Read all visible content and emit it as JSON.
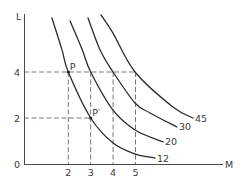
{
  "chart_data": {
    "type": "line",
    "title": "",
    "xlabel": "M",
    "ylabel": "L",
    "xlim": [
      0,
      8.9
    ],
    "ylim": [
      0,
      6.5
    ],
    "grid": false,
    "legend": "none (series labelled at curve ends)",
    "origin_label": "0",
    "x_ticks": [
      {
        "value": 2,
        "label": "2"
      },
      {
        "value": 3,
        "label": "3"
      },
      {
        "value": 4,
        "label": "4"
      },
      {
        "value": 5,
        "label": "5"
      }
    ],
    "y_ticks": [
      {
        "value": 2,
        "label": "2"
      },
      {
        "value": 4,
        "label": "4"
      }
    ],
    "series": [
      {
        "name": "12",
        "points": [
          [
            1.27,
            6.35
          ],
          [
            1.72,
            4.96
          ],
          [
            2,
            4
          ],
          [
            3,
            2
          ],
          [
            4,
            0.91
          ],
          [
            5,
            0.43
          ],
          [
            5.87,
            0.26
          ]
        ]
      },
      {
        "name": "20",
        "points": [
          [
            2.08,
            6.22
          ],
          [
            2.61,
            5.0
          ],
          [
            3,
            4
          ],
          [
            3.99,
            2.35
          ],
          [
            4.98,
            1.48
          ],
          [
            6.23,
            0.96
          ]
        ]
      },
      {
        "name": "30",
        "points": [
          [
            2.88,
            6.35
          ],
          [
            3.42,
            4.96
          ],
          [
            4,
            4
          ],
          [
            4.98,
            2.65
          ],
          [
            5.65,
            2.22
          ],
          [
            6.85,
            1.61
          ]
        ]
      },
      {
        "name": "45",
        "points": [
          [
            3.46,
            6.48
          ],
          [
            3.99,
            5.7
          ],
          [
            4.98,
            4
          ],
          [
            6.67,
            2.48
          ],
          [
            7.57,
            2.0
          ]
        ]
      }
    ],
    "reference_lines": [
      {
        "from": [
          0,
          4
        ],
        "to": [
          5,
          4
        ]
      },
      {
        "from": [
          0,
          2
        ],
        "to": [
          3,
          2
        ]
      },
      {
        "from": [
          2,
          4
        ],
        "to": [
          2,
          0
        ]
      },
      {
        "from": [
          3,
          4
        ],
        "to": [
          3,
          0
        ]
      },
      {
        "from": [
          4,
          4
        ],
        "to": [
          4,
          0
        ]
      },
      {
        "from": [
          5,
          4
        ],
        "to": [
          5,
          0
        ]
      }
    ],
    "annotations": [
      {
        "label": "P",
        "x": 2,
        "y": 4
      },
      {
        "label": "P′",
        "x": 3,
        "y": 2
      }
    ]
  }
}
